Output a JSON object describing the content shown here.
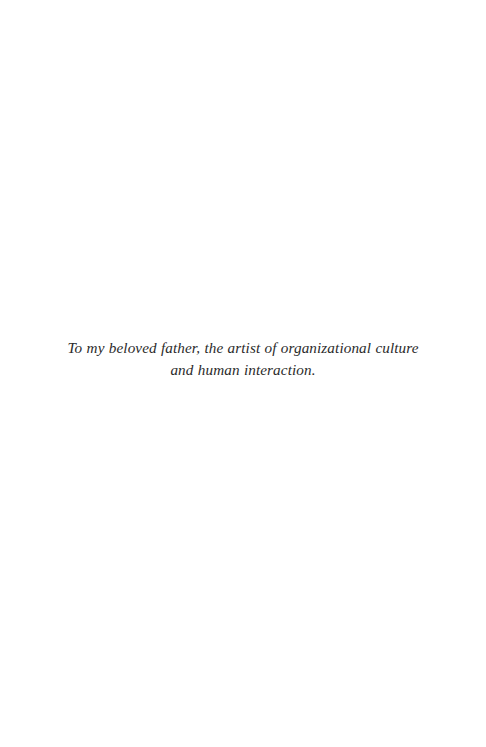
{
  "page": {
    "background_color": "#ffffff",
    "width": 486,
    "height": 747,
    "type": "book-dedication-page"
  },
  "dedication": {
    "text": "To my beloved father, the artist of organizational culture and human interaction.",
    "line_1": "To my beloved father, the artist of organizational culture and",
    "line_2": "human interaction.",
    "style": "italic-serif",
    "alignment": "center",
    "text_color": "#2b2b2b"
  }
}
